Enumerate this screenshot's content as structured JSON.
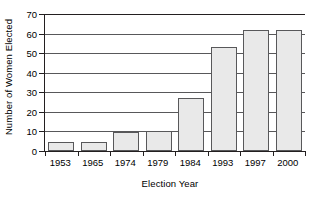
{
  "chart_data": {
    "type": "bar",
    "title": "",
    "xlabel": "Election Year",
    "ylabel": "Number of Women Elected",
    "categories": [
      "1953",
      "1965",
      "1974",
      "1979",
      "1984",
      "1993",
      "1997",
      "2000"
    ],
    "values": [
      4.5,
      4.5,
      9.5,
      10,
      27,
      53,
      62,
      62
    ],
    "ylim": [
      0,
      70
    ],
    "ytick_labels": [
      "0",
      "10",
      "20",
      "30",
      "40",
      "50",
      "60",
      "70"
    ],
    "ytick_values": [
      0,
      10,
      20,
      30,
      40,
      50,
      60,
      70
    ],
    "grid": "horizontal",
    "legend": "none",
    "colors": {
      "bar_fill": "#e9e9e9",
      "bar_stroke": "#58585a",
      "axis": "#231f20",
      "grid": "#58585a",
      "background": "#ffffff",
      "text": "#000000"
    }
  }
}
